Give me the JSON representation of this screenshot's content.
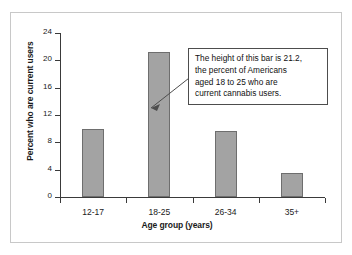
{
  "chart_data": {
    "type": "bar",
    "title": "",
    "categories": [
      "12-17",
      "18-25",
      "26-34",
      "35+"
    ],
    "values": [
      9.9,
      21.2,
      9.6,
      3.5
    ],
    "xlabel": "Age group (years)",
    "ylabel": "Percent who are current users",
    "ylim": [
      0,
      24
    ],
    "yticks": [
      0,
      4,
      8,
      12,
      16,
      20,
      24
    ],
    "ytick_labels": [
      "0",
      "4",
      "8",
      "12",
      "16",
      "20",
      "24"
    ],
    "grid": false,
    "legend": "none",
    "bar_color": "#a3a3a3",
    "bar_edge_color": "#6e6e6e",
    "axis_color": "#3a3a3a",
    "annotations": [
      {
        "text": "The height of this bar is 21.2, the percent of Americans aged 18 to 25 who are current cannabis users.",
        "target_category": "18-25",
        "target_value": 21.2
      }
    ]
  },
  "annotation": {
    "line1": "The height of this bar is 21.2,",
    "line2": "the percent of Americans",
    "line3": "aged 18 to 25 who are",
    "line4": "current cannabis users."
  }
}
